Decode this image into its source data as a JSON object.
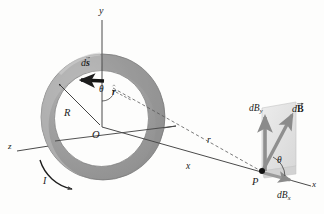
{
  "figure": {
    "background_color": "#fdfdfc",
    "ring_fill_outer": "#9a9a9a",
    "ring_fill_inner": "#c9c9c9",
    "plane_fill": "#e2e2e2",
    "arrow_color": "#8f8f8f",
    "axis_color": "#4a4a4a",
    "text_color": "#1a1a1a"
  },
  "axes": {
    "y_label": "y",
    "z_label": "z",
    "x_label": "x"
  },
  "loop": {
    "origin_label": "O",
    "radius_label": "R",
    "current_label": "I",
    "element_label": "ds",
    "element_label_full": "d⃗s",
    "unit_vector_label": "r",
    "unit_vector_label_full": "r̂",
    "angle_label": "θ"
  },
  "field_point": {
    "point_label": "P",
    "distance_label": "r",
    "axial_distance_label": "x",
    "field_label": "dB",
    "field_label_full": "d⃗B",
    "component_y_label": "dB",
    "component_y_sub": "y",
    "component_x_label": "dB",
    "component_x_sub": "x",
    "angle_label": "θ"
  }
}
